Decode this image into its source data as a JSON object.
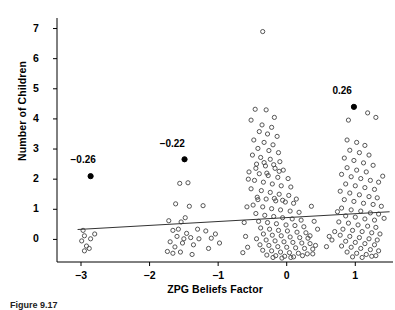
{
  "figure": {
    "caption": "Figure 9.17",
    "width": 395,
    "height": 308
  },
  "chart_data": {
    "type": "scatter",
    "title": "",
    "xlabel": "ZPG Beliefs Factor",
    "ylabel": "Number of Children",
    "xlim": [
      -3.35,
      1.55
    ],
    "ylim": [
      -0.75,
      7.35
    ],
    "xticks": [
      -3,
      -2,
      -1,
      0,
      1
    ],
    "xticklabels": [
      "−3",
      "−2",
      "−1",
      "0",
      "1"
    ],
    "yticks": [
      0,
      1,
      2,
      3,
      4,
      5,
      6,
      7
    ],
    "yticklabels": [
      "0",
      "1",
      "2",
      "3",
      "4",
      "5",
      "6",
      "7"
    ],
    "grid": false,
    "legend": null,
    "marker": "open-circle",
    "marker_color": "#4d4d4d",
    "marker_size": 4.2,
    "trendline": {
      "type": "linear",
      "color": "#333333",
      "x_start": -3.05,
      "y_start": 0.33,
      "x_end": 1.5,
      "y_end": 0.92
    },
    "annotations": [
      {
        "label": "−0.26",
        "point_x": -2.86,
        "point_y": 2.1,
        "label_x": -2.92,
        "label_y": 2.62,
        "filled": true
      },
      {
        "label": "−0.22",
        "point_x": -1.49,
        "point_y": 2.66,
        "label_x": -1.62,
        "label_y": 3.18,
        "filled": true
      },
      {
        "label": "0.26",
        "point_x": 0.98,
        "point_y": 4.4,
        "label_x": 0.9,
        "label_y": 4.92,
        "filled": true
      }
    ],
    "points": [
      [
        -2.97,
        0.3
      ],
      [
        -2.95,
        0.12
      ],
      [
        -2.99,
        -0.05
      ],
      [
        -2.92,
        -0.22
      ],
      [
        -2.95,
        -0.38
      ],
      [
        -2.86,
        0.02
      ],
      [
        -2.8,
        0.18
      ],
      [
        -2.88,
        -0.3
      ],
      [
        -1.72,
        0.62
      ],
      [
        -1.66,
        0.3
      ],
      [
        -1.6,
        0.1
      ],
      [
        -1.7,
        -0.08
      ],
      [
        -1.63,
        -0.25
      ],
      [
        -1.55,
        -0.42
      ],
      [
        -1.74,
        -0.4
      ],
      [
        -1.5,
        0.02
      ],
      [
        -1.62,
        1.18
      ],
      [
        -1.56,
        1.86
      ],
      [
        -1.44,
        1.88
      ],
      [
        -1.42,
        1.1
      ],
      [
        -1.48,
        0.72
      ],
      [
        -1.54,
        0.58
      ],
      [
        -1.58,
        0.34
      ],
      [
        -1.46,
        0.2
      ],
      [
        -1.4,
        0.06
      ],
      [
        -1.36,
        -0.18
      ],
      [
        -1.52,
        -0.12
      ],
      [
        -1.38,
        -0.5
      ],
      [
        -1.66,
        -0.46
      ],
      [
        -1.3,
        0.34
      ],
      [
        -1.28,
        0.02
      ],
      [
        -1.22,
        1.12
      ],
      [
        -1.18,
        0.28
      ],
      [
        -1.1,
        0.04
      ],
      [
        -1.14,
        -0.3
      ],
      [
        -1.04,
        0.18
      ],
      [
        -0.98,
        -0.12
      ],
      [
        -0.35,
        6.9
      ],
      [
        -0.46,
        4.32
      ],
      [
        -0.3,
        4.3
      ],
      [
        -0.18,
        4.05
      ],
      [
        -0.52,
        3.96
      ],
      [
        -0.36,
        3.8
      ],
      [
        -0.22,
        3.72
      ],
      [
        -0.4,
        3.58
      ],
      [
        -0.28,
        3.5
      ],
      [
        -0.14,
        3.42
      ],
      [
        -0.48,
        3.3
      ],
      [
        -0.33,
        3.22
      ],
      [
        -0.2,
        3.14
      ],
      [
        -0.42,
        3.02
      ],
      [
        -0.26,
        2.95
      ],
      [
        -0.12,
        2.88
      ],
      [
        -0.5,
        2.8
      ],
      [
        -0.38,
        2.72
      ],
      [
        -0.24,
        2.66
      ],
      [
        -0.1,
        2.58
      ],
      [
        -0.44,
        2.5
      ],
      [
        -0.31,
        2.44
      ],
      [
        -0.17,
        2.36
      ],
      [
        -0.05,
        2.3
      ],
      [
        -0.55,
        2.24
      ],
      [
        -0.4,
        2.18
      ],
      [
        -0.27,
        2.12
      ],
      [
        -0.13,
        2.06
      ],
      [
        0.02,
        2.02
      ],
      [
        -0.47,
        1.96
      ],
      [
        -0.34,
        1.9
      ],
      [
        -0.21,
        1.84
      ],
      [
        -0.08,
        1.78
      ],
      [
        0.06,
        1.74
      ],
      [
        -0.52,
        1.68
      ],
      [
        -0.37,
        1.62
      ],
      [
        -0.24,
        1.56
      ],
      [
        -0.11,
        1.5
      ],
      [
        0.03,
        1.46
      ],
      [
        -0.43,
        1.4
      ],
      [
        -0.3,
        1.34
      ],
      [
        -0.16,
        1.28
      ],
      [
        -0.02,
        1.24
      ],
      [
        0.1,
        1.2
      ],
      [
        -0.49,
        1.14
      ],
      [
        -0.35,
        1.08
      ],
      [
        -0.22,
        1.02
      ],
      [
        -0.09,
        0.98
      ],
      [
        0.05,
        0.94
      ],
      [
        0.18,
        0.9
      ],
      [
        -0.45,
        0.86
      ],
      [
        -0.32,
        0.8
      ],
      [
        -0.19,
        0.76
      ],
      [
        -0.06,
        0.72
      ],
      [
        0.08,
        0.68
      ],
      [
        0.21,
        0.64
      ],
      [
        -0.41,
        0.6
      ],
      [
        -0.28,
        0.56
      ],
      [
        -0.15,
        0.52
      ],
      [
        -0.01,
        0.48
      ],
      [
        0.12,
        0.46
      ],
      [
        0.25,
        0.42
      ],
      [
        -0.38,
        0.38
      ],
      [
        -0.25,
        0.34
      ],
      [
        -0.12,
        0.3
      ],
      [
        0.01,
        0.28
      ],
      [
        0.15,
        0.24
      ],
      [
        0.28,
        0.22
      ],
      [
        -0.34,
        0.18
      ],
      [
        -0.21,
        0.14
      ],
      [
        -0.08,
        0.12
      ],
      [
        0.05,
        0.08
      ],
      [
        0.19,
        0.06
      ],
      [
        0.31,
        0.04
      ],
      [
        -0.44,
        0.02
      ],
      [
        -0.3,
        -0.02
      ],
      [
        -0.17,
        -0.05
      ],
      [
        -0.04,
        -0.08
      ],
      [
        0.09,
        -0.1
      ],
      [
        0.22,
        -0.12
      ],
      [
        0.34,
        -0.14
      ],
      [
        -0.39,
        -0.18
      ],
      [
        -0.26,
        -0.2
      ],
      [
        -0.13,
        -0.24
      ],
      [
        0.0,
        -0.26
      ],
      [
        0.13,
        -0.28
      ],
      [
        0.26,
        -0.3
      ],
      [
        0.38,
        -0.32
      ],
      [
        -0.35,
        -0.36
      ],
      [
        -0.22,
        -0.38
      ],
      [
        -0.09,
        -0.42
      ],
      [
        0.04,
        -0.44
      ],
      [
        0.17,
        -0.46
      ],
      [
        0.3,
        -0.48
      ],
      [
        -0.29,
        -0.52
      ],
      [
        -0.16,
        -0.54
      ],
      [
        -0.03,
        -0.56
      ],
      [
        0.1,
        -0.58
      ],
      [
        0.23,
        -0.54
      ],
      [
        -0.2,
        -0.6
      ],
      [
        -0.07,
        -0.62
      ],
      [
        0.06,
        -0.6
      ],
      [
        -0.58,
        1.08
      ],
      [
        -0.62,
        0.56
      ],
      [
        -0.6,
        0.1
      ],
      [
        -0.57,
        -0.26
      ],
      [
        -0.64,
        -0.44
      ],
      [
        -0.56,
        2.0
      ],
      [
        0.36,
        1.1
      ],
      [
        0.4,
        0.6
      ],
      [
        0.34,
        0.12
      ],
      [
        0.42,
        -0.2
      ],
      [
        0.38,
        -0.48
      ],
      [
        0.45,
        0.34
      ],
      [
        0.62,
        0.1
      ],
      [
        0.58,
        -0.24
      ],
      [
        0.66,
        -0.02
      ],
      [
        0.7,
        0.26
      ],
      [
        -0.33,
        2.55
      ],
      [
        -0.19,
        2.48
      ],
      [
        -0.45,
        2.36
      ],
      [
        -0.11,
        2.26
      ],
      [
        -0.29,
        2.2
      ],
      [
        -0.42,
        1.32
      ],
      [
        -0.18,
        1.36
      ],
      [
        -0.06,
        1.3
      ],
      [
        0.14,
        1.34
      ],
      [
        0.88,
        3.3
      ],
      [
        1.02,
        3.22
      ],
      [
        1.14,
        3.12
      ],
      [
        0.92,
        2.96
      ],
      [
        1.06,
        2.88
      ],
      [
        1.2,
        2.8
      ],
      [
        0.84,
        2.7
      ],
      [
        0.98,
        2.62
      ],
      [
        1.12,
        2.54
      ],
      [
        1.26,
        2.46
      ],
      [
        0.88,
        2.38
      ],
      [
        1.02,
        2.3
      ],
      [
        1.16,
        2.24
      ],
      [
        0.8,
        2.16
      ],
      [
        0.94,
        2.08
      ],
      [
        1.08,
        2.02
      ],
      [
        1.22,
        1.96
      ],
      [
        1.34,
        1.9
      ],
      [
        0.86,
        1.84
      ],
      [
        1.0,
        1.78
      ],
      [
        1.14,
        1.72
      ],
      [
        1.28,
        1.66
      ],
      [
        0.78,
        1.6
      ],
      [
        0.92,
        1.54
      ],
      [
        1.06,
        1.48
      ],
      [
        1.2,
        1.42
      ],
      [
        1.32,
        1.38
      ],
      [
        0.84,
        1.32
      ],
      [
        0.98,
        1.26
      ],
      [
        1.12,
        1.2
      ],
      [
        1.26,
        1.16
      ],
      [
        1.38,
        1.1
      ],
      [
        0.8,
        1.04
      ],
      [
        0.94,
        0.98
      ],
      [
        1.08,
        0.94
      ],
      [
        1.22,
        0.88
      ],
      [
        1.34,
        0.84
      ],
      [
        0.86,
        0.78
      ],
      [
        1.0,
        0.74
      ],
      [
        1.14,
        0.68
      ],
      [
        1.28,
        0.64
      ],
      [
        0.76,
        0.58
      ],
      [
        0.9,
        0.54
      ],
      [
        1.04,
        0.48
      ],
      [
        1.18,
        0.44
      ],
      [
        1.3,
        0.4
      ],
      [
        0.82,
        0.34
      ],
      [
        0.96,
        0.3
      ],
      [
        1.1,
        0.26
      ],
      [
        1.24,
        0.22
      ],
      [
        1.36,
        0.18
      ],
      [
        0.78,
        0.14
      ],
      [
        0.92,
        0.1
      ],
      [
        1.06,
        0.06
      ],
      [
        1.2,
        0.02
      ],
      [
        1.32,
        -0.02
      ],
      [
        0.86,
        -0.06
      ],
      [
        1.0,
        -0.1
      ],
      [
        1.14,
        -0.14
      ],
      [
        1.28,
        -0.18
      ],
      [
        0.8,
        -0.22
      ],
      [
        0.94,
        -0.26
      ],
      [
        1.08,
        -0.3
      ],
      [
        1.22,
        -0.34
      ],
      [
        1.34,
        -0.38
      ],
      [
        0.88,
        -0.42
      ],
      [
        1.02,
        -0.46
      ],
      [
        1.16,
        -0.5
      ],
      [
        1.3,
        -0.54
      ],
      [
        0.96,
        -0.58
      ],
      [
        1.1,
        -0.6
      ],
      [
        1.24,
        -0.56
      ],
      [
        0.9,
        3.96
      ],
      [
        1.18,
        4.2
      ],
      [
        1.3,
        4.05
      ],
      [
        0.74,
        0.92
      ],
      [
        1.4,
        2.1
      ],
      [
        1.42,
        0.7
      ]
    ]
  }
}
